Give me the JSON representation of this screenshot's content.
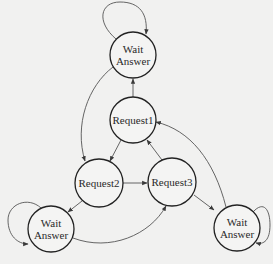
{
  "diagram": {
    "type": "state-machine",
    "colors": {
      "background": "#f1f1f0",
      "stroke": "#2a2a2a",
      "edge": "#4a4a4a",
      "text": "#2a2a2a"
    },
    "nodes": [
      {
        "id": "wait_top",
        "label_line1": "Wait",
        "label_line2": "Answer",
        "cx": 133,
        "cy": 55,
        "r": 23
      },
      {
        "id": "request1",
        "label_line1": "Request1",
        "label_line2": "",
        "cx": 133,
        "cy": 120,
        "r": 23
      },
      {
        "id": "request2",
        "label_line1": "Request2",
        "label_line2": "",
        "cx": 99,
        "cy": 183,
        "r": 24
      },
      {
        "id": "request3",
        "label_line1": "Request3",
        "label_line2": "",
        "cx": 172,
        "cy": 182,
        "r": 24
      },
      {
        "id": "wait_left",
        "label_line1": "Wait",
        "label_line2": "Answer",
        "cx": 51,
        "cy": 229,
        "r": 23
      },
      {
        "id": "wait_right",
        "label_line1": "Wait",
        "label_line2": "Answer",
        "cx": 237,
        "cy": 228,
        "r": 23
      }
    ],
    "edges": [
      {
        "from": "request1",
        "to": "wait_top"
      },
      {
        "from": "wait_top",
        "to": "request2"
      },
      {
        "from": "request1",
        "to": "request2"
      },
      {
        "from": "request3",
        "to": "request1"
      },
      {
        "from": "request2",
        "to": "request3"
      },
      {
        "from": "request2",
        "to": "wait_left"
      },
      {
        "from": "wait_left",
        "to": "request3"
      },
      {
        "from": "request3",
        "to": "wait_right"
      },
      {
        "from": "wait_right",
        "to": "request1"
      },
      {
        "from": "wait_top",
        "to": "wait_top",
        "self_loop": true
      },
      {
        "from": "wait_left",
        "to": "wait_left",
        "self_loop": true
      },
      {
        "from": "wait_right",
        "to": "wait_right",
        "self_loop": true
      }
    ]
  }
}
